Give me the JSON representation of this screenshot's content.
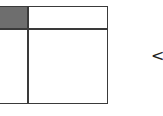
{
  "diagram": {
    "grid": {
      "rows": 2,
      "cols": 2,
      "shaded_cell": {
        "row": 0,
        "col": 0,
        "color": "#6e6e6e"
      },
      "line_color": "#3a3a3a"
    },
    "arrow": {
      "glyph": "<",
      "direction": "left"
    }
  }
}
